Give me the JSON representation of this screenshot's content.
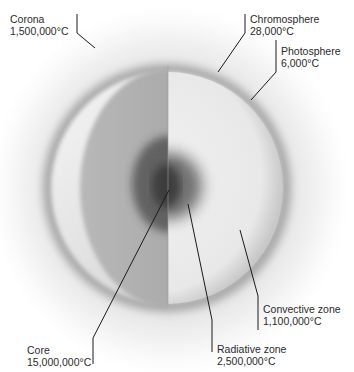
{
  "colors": {
    "background": "#ffffff",
    "glow": "#d8d8d8",
    "outer_shell": "#bdbdbd",
    "convective_zone": "#ececec",
    "radiative_zone": "#8c8c8c",
    "core": "#3a3a3a",
    "leader_line": "#1a1a1a",
    "text": "#2a2a2a"
  },
  "labels": {
    "corona": {
      "name": "Corona",
      "temperature": "1,500,000°C"
    },
    "chromosphere": {
      "name": "Chromosphere",
      "temperature": "28,000°C"
    },
    "photosphere": {
      "name": "Photosphere",
      "temperature": "6,000°C"
    },
    "convective_zone": {
      "name": "Convective zone",
      "temperature": "1,100,000°C"
    },
    "radiative_zone": {
      "name": "Radiative zone",
      "temperature": "2,500,000°C"
    },
    "core": {
      "name": "Core",
      "temperature": "15,000,000°C"
    }
  }
}
